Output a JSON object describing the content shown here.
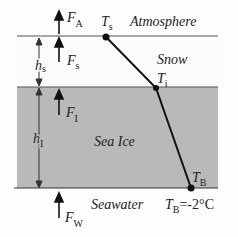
{
  "diagram": {
    "labels": {
      "atmosphere": "Atmosphere",
      "snow": "Snow",
      "sea_ice": "Sea Ice",
      "seawater": "Seawater"
    },
    "fluxes": {
      "atmosphere": {
        "symbol": "F",
        "sub": "A"
      },
      "snow": {
        "symbol": "F",
        "sub": "s"
      },
      "ice": {
        "symbol": "F",
        "sub": "I"
      },
      "water": {
        "symbol": "F",
        "sub": "W"
      }
    },
    "thickness": {
      "snow": {
        "symbol": "h",
        "sub": "s"
      },
      "ice": {
        "symbol": "h",
        "sub": "I"
      }
    },
    "temperatures": {
      "surface": {
        "symbol": "T",
        "sub": "s"
      },
      "interface": {
        "symbol": "T",
        "sub": "i"
      },
      "bottom": {
        "symbol": "T",
        "sub": "B"
      },
      "bottom_value": "=-2°C"
    },
    "colors": {
      "ice_fill": "#b9b9b9",
      "snow_fill": "#fbfbfb",
      "line": "#222222"
    }
  }
}
